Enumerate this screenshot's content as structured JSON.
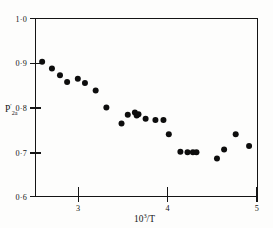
{
  "chart_data": {
    "type": "scatter",
    "title": "",
    "subtitle": "",
    "xlabel": "10³/T",
    "xlabel_parts": {
      "mantissa": "10",
      "exponent": "3",
      "divider": "/T"
    },
    "ylabel": "P′2a",
    "ylabel_parts": {
      "base": "P",
      "prime": "′",
      "subscript": "2a"
    },
    "xlim": [
      2.5,
      5.0
    ],
    "ylim": [
      0.6,
      1.0
    ],
    "xticks": [
      3,
      4,
      5
    ],
    "xtick_labels": [
      "3",
      "4",
      "5"
    ],
    "yticks": [
      0.6,
      0.7,
      0.8,
      0.9,
      1.0
    ],
    "ytick_labels": [
      "0·6",
      "0·7",
      "0·8",
      "0·9",
      "1·0"
    ],
    "grid": false,
    "legend": "none",
    "marker": "filled-circle",
    "marker_color": "#0d0d0d",
    "marker_size": 3.0,
    "points": [
      {
        "x": 2.58,
        "y": 0.902
      },
      {
        "x": 2.69,
        "y": 0.887
      },
      {
        "x": 2.78,
        "y": 0.872
      },
      {
        "x": 2.86,
        "y": 0.857
      },
      {
        "x": 2.98,
        "y": 0.864
      },
      {
        "x": 3.06,
        "y": 0.855
      },
      {
        "x": 3.18,
        "y": 0.838
      },
      {
        "x": 3.3,
        "y": 0.8
      },
      {
        "x": 3.47,
        "y": 0.764
      },
      {
        "x": 3.54,
        "y": 0.784
      },
      {
        "x": 3.62,
        "y": 0.789
      },
      {
        "x": 3.64,
        "y": 0.782
      },
      {
        "x": 3.66,
        "y": 0.785
      },
      {
        "x": 3.74,
        "y": 0.775
      },
      {
        "x": 3.85,
        "y": 0.772
      },
      {
        "x": 3.94,
        "y": 0.772
      },
      {
        "x": 4.0,
        "y": 0.74
      },
      {
        "x": 4.13,
        "y": 0.701
      },
      {
        "x": 4.21,
        "y": 0.7
      },
      {
        "x": 4.27,
        "y": 0.7
      },
      {
        "x": 4.31,
        "y": 0.7
      },
      {
        "x": 4.54,
        "y": 0.686
      },
      {
        "x": 4.62,
        "y": 0.706
      },
      {
        "x": 4.75,
        "y": 0.74
      },
      {
        "x": 4.9,
        "y": 0.714
      }
    ]
  },
  "figure": {
    "frame": {
      "left": 35,
      "right": 258,
      "top": 18,
      "bottom": 197
    },
    "background": "#fdfdfc",
    "ink_color": "#141414"
  }
}
